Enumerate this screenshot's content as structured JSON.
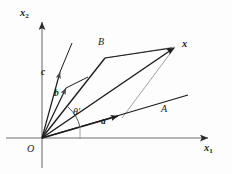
{
  "figure": {
    "background_color": "#fdfdfd",
    "stroke_color": "#1b1b1b",
    "thin_stroke_color": "#6e6e6e",
    "axes": {
      "x_axis_label": "x",
      "x_axis_subscript": "1",
      "y_axis_label": "x",
      "y_axis_subscript": "2",
      "origin_label": "O"
    },
    "labels": {
      "line_A": "A",
      "line_B": "B",
      "vector_x": "x",
      "vector_a": "a",
      "vector_b": "b",
      "vector_c": "c",
      "angle": "θ′"
    },
    "geometry": {
      "origin": [
        42,
        138
      ],
      "x_axis_tip": [
        216,
        138
      ],
      "y_axis_tip": [
        42,
        14
      ],
      "point_x": [
        175,
        47
      ],
      "point_B_vertex": [
        105,
        58
      ],
      "point_a_foot": [
        122,
        118
      ],
      "line_A_tip": [
        191,
        94
      ],
      "vector_c_tip": [
        72,
        43
      ],
      "vector_b_tip": [
        67,
        86
      ],
      "angle_arc_radius": 38,
      "angle_tick_x": 80
    }
  }
}
